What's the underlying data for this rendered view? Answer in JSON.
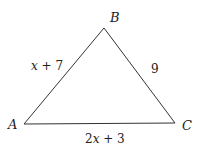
{
  "diagram": {
    "type": "triangle",
    "vertices": [
      {
        "id": "A",
        "label": "A"
      },
      {
        "id": "B",
        "label": "B"
      },
      {
        "id": "C",
        "label": "C"
      }
    ],
    "sides": [
      {
        "id": "AB",
        "label": "x + 7"
      },
      {
        "id": "BC",
        "label": "9"
      },
      {
        "id": "AC",
        "label": "2x + 3"
      }
    ],
    "colors": {
      "line": "#333333",
      "text": "#222222"
    }
  }
}
